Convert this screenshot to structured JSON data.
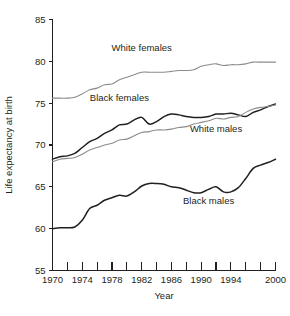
{
  "chart_data": {
    "type": "line",
    "title": "",
    "xlabel": "Year",
    "ylabel": "Life expectancy at birth",
    "xlim": [
      1970,
      2000
    ],
    "ylim": [
      55,
      85
    ],
    "grid": false,
    "legend_position": "inline-annotations",
    "x_tick_values": [
      1970,
      1972,
      1974,
      1976,
      1978,
      1980,
      1982,
      1984,
      1986,
      1988,
      1990,
      1992,
      1994,
      1996,
      1998,
      2000
    ],
    "x_tick_labels": [
      "1970",
      "",
      "1974",
      "",
      "1978",
      "",
      "1982",
      "",
      "1986",
      "",
      "1990",
      "",
      "1994",
      "",
      "",
      "2000"
    ],
    "y_tick_values": [
      55,
      60,
      65,
      70,
      75,
      80,
      85
    ],
    "y_tick_labels": [
      "55",
      "60",
      "65",
      "70",
      "75",
      "80",
      "85"
    ],
    "x": [
      1970,
      1971,
      1972,
      1973,
      1974,
      1975,
      1976,
      1977,
      1978,
      1979,
      1980,
      1981,
      1982,
      1983,
      1984,
      1985,
      1986,
      1987,
      1988,
      1989,
      1990,
      1991,
      1992,
      1993,
      1994,
      1995,
      1996,
      1997,
      1998,
      1999,
      2000
    ],
    "series": [
      {
        "name": "White females",
        "color": "#8b8b8b",
        "label_x": 1982,
        "label_y": 81.2,
        "values": [
          75.6,
          75.6,
          75.6,
          75.7,
          76.1,
          76.6,
          76.8,
          77.2,
          77.3,
          77.8,
          78.1,
          78.4,
          78.7,
          78.7,
          78.7,
          78.7,
          78.8,
          78.9,
          78.9,
          79.0,
          79.4,
          79.6,
          79.7,
          79.5,
          79.6,
          79.6,
          79.7,
          79.9,
          79.9,
          79.9,
          79.9
        ]
      },
      {
        "name": "Black females",
        "color": "#231f20",
        "label_x": 1979,
        "label_y": 75.2,
        "values": [
          68.3,
          68.6,
          68.7,
          69.0,
          69.7,
          70.4,
          70.8,
          71.4,
          71.8,
          72.4,
          72.5,
          73.0,
          73.3,
          72.5,
          72.8,
          73.4,
          73.7,
          73.6,
          73.4,
          73.3,
          73.3,
          73.4,
          73.7,
          73.7,
          73.8,
          73.6,
          73.4,
          73.9,
          74.2,
          74.6,
          74.9
        ]
      },
      {
        "name": "White males",
        "color": "#8b8b8b",
        "label_x": 1992,
        "label_y": 71.6,
        "values": [
          68.0,
          68.3,
          68.4,
          68.5,
          68.9,
          69.4,
          69.7,
          70.0,
          70.2,
          70.6,
          70.7,
          71.1,
          71.5,
          71.6,
          71.8,
          71.8,
          71.9,
          72.1,
          72.2,
          72.5,
          72.7,
          72.9,
          73.2,
          73.1,
          73.3,
          73.4,
          73.9,
          74.3,
          74.5,
          74.6,
          74.8
        ]
      },
      {
        "name": "Black males",
        "color": "#231f20",
        "label_x": 1991,
        "label_y": 63.0,
        "values": [
          60.0,
          60.1,
          60.1,
          60.2,
          61.0,
          62.4,
          62.8,
          63.4,
          63.7,
          64.0,
          63.9,
          64.4,
          65.1,
          65.4,
          65.4,
          65.3,
          65.0,
          64.9,
          64.6,
          64.3,
          64.3,
          64.7,
          65.0,
          64.4,
          64.4,
          64.9,
          66.0,
          67.2,
          67.6,
          67.9,
          68.3
        ]
      }
    ]
  }
}
